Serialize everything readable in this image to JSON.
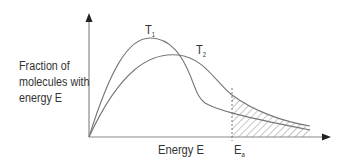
{
  "diagram": {
    "type": "Maxwell-Boltzmann energy distribution",
    "y_axis_label": "Fraction of molecules with energy E",
    "y_axis_label_lines": [
      "Fraction of",
      "molecules with",
      "energy E"
    ],
    "x_axis_label": "Energy E",
    "curves": [
      {
        "name": "T1",
        "label_main": "T",
        "label_sub": "1",
        "description": "lower temperature, taller narrower peak"
      },
      {
        "name": "T2",
        "label_main": "T",
        "label_sub": "2",
        "description": "higher temperature, lower broader peak"
      }
    ],
    "marker": {
      "label_main": "E",
      "label_sub": "a",
      "description": "activation energy (dashed vertical line)"
    },
    "shaded_region": "area under curves beyond Ea (hatched)",
    "colors": {
      "line": "#777777",
      "axis": "#888888",
      "text": "#333333",
      "hatch": "#888888"
    }
  }
}
